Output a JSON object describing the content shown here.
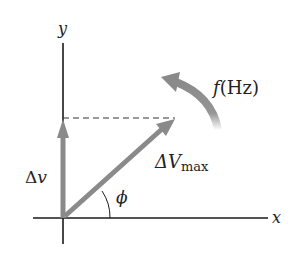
{
  "diagram": {
    "type": "phasor-diagram",
    "axes": {
      "x_label": "x",
      "y_label": "y",
      "color": "#1a1a1a"
    },
    "phasor": {
      "label_main": "ΔV",
      "label_sub": "max",
      "color": "#8a8a8a"
    },
    "projection": {
      "label_delta": "Δ",
      "label_var": "v",
      "color": "#8a8a8a"
    },
    "angle": {
      "label": "ϕ"
    },
    "rotation": {
      "label_f": "f",
      "label_unit": "(Hz)",
      "color": "#8a8a8a",
      "direction": "counterclockwise"
    },
    "guide_line": {
      "style": "dashed",
      "color": "#333333"
    }
  }
}
